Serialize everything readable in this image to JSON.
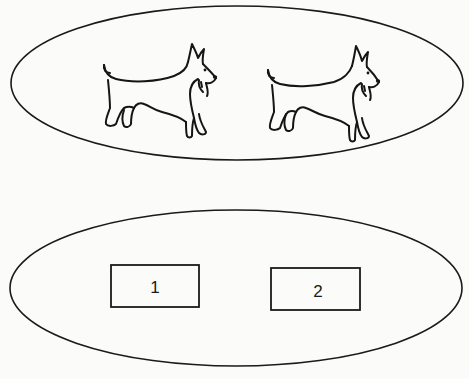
{
  "diagram": {
    "top_group": {
      "name": "dogs",
      "items": [
        {
          "icon": "scottish-terrier-icon",
          "label": "dog 1"
        },
        {
          "icon": "scottish-terrier-icon",
          "label": "dog 2"
        }
      ]
    },
    "bottom_group": {
      "name": "boxes",
      "items": [
        {
          "label": "1"
        },
        {
          "label": "2"
        }
      ]
    }
  }
}
